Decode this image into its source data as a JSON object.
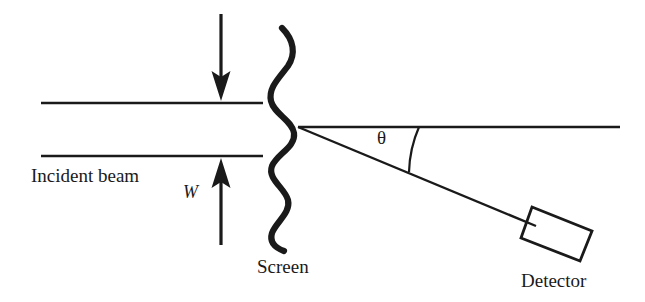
{
  "figure": {
    "background_color": "#ffffff",
    "stroke_color": "#1a1a1a",
    "width": 645,
    "height": 302
  },
  "labels": {
    "incident_beam": "Incident beam",
    "width": "W",
    "screen": "Screen",
    "detector": "Detector",
    "theta": "θ"
  },
  "elements": {
    "slit_top_line": "slit-upper-boundary",
    "slit_bottom_line": "slit-lower-boundary",
    "down_arrow": "slit-width-arrow-down",
    "up_arrow": "slit-width-arrow-up",
    "wavy_screen": "screen-wavy-line",
    "transmitted_ray": "transmitted-beam-axis",
    "scattered_ray": "scattered-beam-to-detector",
    "angle_arc": "scattering-angle-arc",
    "detector_box": "detector-rectangle"
  },
  "geometry": {
    "slit_top_line_y": 103,
    "slit_bottom_line_y": 156,
    "slit_line_x_start": 41,
    "slit_line_x_end": 263,
    "scattering_vertex": [
      298,
      127
    ],
    "horizontal_ray_end_x": 620,
    "scattered_ray_end": [
      536,
      226
    ],
    "scattering_angle_degrees": 22,
    "detector_corners": [
      [
        532,
        207
      ],
      [
        592,
        231
      ],
      [
        580,
        261
      ],
      [
        521,
        238
      ]
    ]
  }
}
